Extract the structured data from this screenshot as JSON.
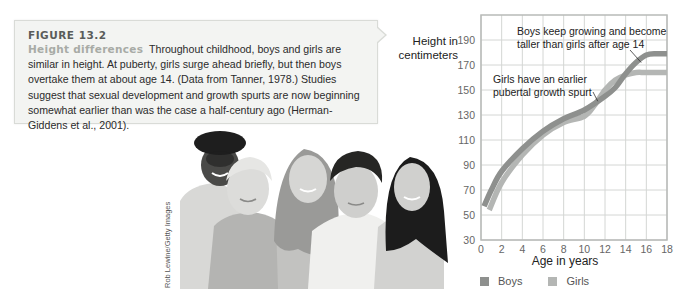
{
  "caption": {
    "figure_label": "FIGURE 13.2",
    "title": "Height differences",
    "body": "Throughout childhood, boys and girls are similar in height. At puberty, girls surge ahead briefly, but then boys overtake them at about age 14. (Data from Tanner, 1978.) Studies suggest that sexual development and growth spurts are now beginning somewhat earlier than was the case a half-century ago (Herman-Giddens et al., 2001)."
  },
  "photo": {
    "description": "Five smiling children of diverse backgrounds posing together",
    "credit": "Rob Lewine/Getty Images"
  },
  "chart_data": {
    "type": "line",
    "title": "",
    "xlabel": "Age in years",
    "ylabel": "Height in centimeters",
    "xlim": [
      0,
      18
    ],
    "ylim": [
      30,
      210
    ],
    "x_ticks": [
      0,
      2,
      4,
      6,
      8,
      10,
      12,
      14,
      16,
      18
    ],
    "y_ticks": [
      30,
      50,
      70,
      90,
      110,
      130,
      150,
      170,
      190
    ],
    "grid": true,
    "legend_position": "bottom",
    "series": [
      {
        "name": "Boys",
        "color": "#8e908e",
        "x": [
          0.3,
          1,
          2,
          4,
          6,
          8,
          10,
          12,
          13,
          14,
          15,
          16,
          17,
          18
        ],
        "values": [
          57,
          70,
          85,
          103,
          117,
          127,
          134,
          145,
          152,
          163,
          172,
          178,
          179,
          179
        ]
      },
      {
        "name": "Girls",
        "color": "#b4b6b4",
        "x": [
          0.8,
          2,
          4,
          6,
          8,
          10,
          11,
          12,
          13,
          14,
          15,
          16,
          18
        ],
        "values": [
          54,
          76,
          98,
          114,
          124,
          129,
          138,
          150,
          158,
          162,
          164,
          164,
          164
        ]
      }
    ],
    "annotations": [
      {
        "text": "Boys keep growing and become taller than girls after age 14",
        "lines": [
          "Boys keep growing and become",
          "taller than girls after age 14"
        ],
        "points_to": {
          "x": 15.5,
          "y": 172
        }
      },
      {
        "text": "Girls have an earlier pubertal growth spurt",
        "lines": [
          "Girls have an earlier",
          "pubertal growth spurt"
        ],
        "points_to": {
          "x": 11.3,
          "y": 141
        }
      }
    ]
  },
  "colors": {
    "caption_bg": "#f3f4f2",
    "caption_border": "#d9dbd7",
    "figure_label": "#5a5c5a",
    "caption_title": "#a8aba6",
    "grid": "#d4d6d4",
    "axis": "#b8bab8"
  }
}
